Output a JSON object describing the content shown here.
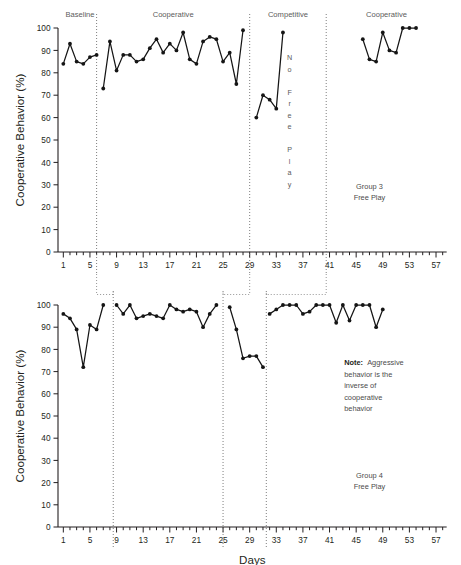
{
  "figure": {
    "width": 461,
    "height": 565,
    "background": "#ffffff",
    "ink_color": "#151515",
    "label_color": "#5b5b5b"
  },
  "axis_common": {
    "ylabel": "Cooperative Behavior (%)",
    "yticks": [
      0,
      10,
      20,
      30,
      40,
      50,
      60,
      70,
      80,
      90,
      100
    ],
    "ylim": [
      0,
      100
    ],
    "xlim": [
      0.2,
      58.8
    ],
    "xticks_labeled": [
      1,
      5,
      9,
      13,
      17,
      21,
      25,
      29,
      33,
      37,
      41,
      45,
      49,
      53,
      57
    ],
    "xtick_step_minor": 1,
    "grid": false,
    "legend": false
  },
  "xlabel": "Days",
  "chart_data": [
    {
      "type": "line",
      "id": "group3",
      "title": "Group 3 Free Play",
      "xlabel": "",
      "ylabel": "Cooperative Behavior (%)",
      "ylim": [
        0,
        100
      ],
      "xlim": [
        0.2,
        58.8
      ],
      "grid": false,
      "legend": false,
      "annotations": [
        {
          "text": "Group 3",
          "x": 47,
          "y": 28
        },
        {
          "text": "Free Play",
          "x": 47,
          "y": 23
        }
      ],
      "no_free_play_text": "No Free Play",
      "no_free_play_letters": [
        "N",
        "o",
        "",
        "F",
        "r",
        "e",
        "e",
        "",
        "P",
        "l",
        "a",
        "y"
      ],
      "phases": [
        {
          "label": "Baseline",
          "start": 1,
          "end": 6
        },
        {
          "label": "Cooperative",
          "start": 6,
          "end": 29
        },
        {
          "label": "Competitive",
          "start": 29,
          "end": 40.5
        },
        {
          "label": "Cooperative",
          "start": 40.5,
          "end": 58.8
        }
      ],
      "phase_boundaries": [
        6.0,
        29.0,
        40.5
      ],
      "series": [
        {
          "name": "Baseline",
          "x": [
            1,
            2,
            3,
            4,
            5,
            6
          ],
          "values": [
            84,
            93,
            85,
            84,
            87,
            88
          ]
        },
        {
          "name": "Cooperative 1",
          "x": [
            7,
            8,
            9,
            10,
            11,
            12,
            13,
            14,
            15,
            16,
            17,
            18,
            19,
            20,
            21,
            22,
            23,
            24,
            25,
            26,
            27,
            28
          ],
          "values": [
            73,
            94,
            81,
            88,
            88,
            85,
            86,
            91,
            95,
            89,
            93,
            90,
            98,
            86,
            84,
            94,
            96,
            95,
            85,
            89,
            75,
            99
          ]
        },
        {
          "name": "Competitive",
          "x": [
            30,
            31,
            32,
            33,
            34
          ],
          "values": [
            60,
            70,
            68,
            64,
            98
          ]
        },
        {
          "name": "Cooperative 2",
          "x": [
            46,
            47,
            48,
            49,
            50,
            51,
            52,
            53,
            54
          ],
          "values": [
            95,
            86,
            85,
            98,
            90,
            89,
            100,
            100,
            100
          ]
        }
      ]
    },
    {
      "type": "line",
      "id": "group4",
      "title": "Group 4 Free Play",
      "xlabel": "Days",
      "ylabel": "Cooperative Behavior (%)",
      "ylim": [
        0,
        100
      ],
      "xlim": [
        0.2,
        58.8
      ],
      "grid": false,
      "legend": false,
      "annotations": [
        {
          "text": "Group 4",
          "x": 47,
          "y": 22
        },
        {
          "text": "Free Play",
          "x": 47,
          "y": 17
        }
      ],
      "note_bold": "Note:",
      "note_lines": [
        "Aggressive",
        "behavior is the",
        "inverse of",
        "cooperative",
        "behavior"
      ],
      "phases": [
        {
          "label": "Baseline",
          "start": 1,
          "end": 8.5
        },
        {
          "label": "Cooperative",
          "start": 8.5,
          "end": 25
        },
        {
          "label": "Competitive",
          "start": 25,
          "end": 31.5
        },
        {
          "label": "Cooperative",
          "start": 31.5,
          "end": 58.8
        }
      ],
      "phase_boundaries": [
        8.5,
        25.0,
        31.5
      ],
      "series": [
        {
          "name": "Baseline",
          "x": [
            1,
            2,
            3,
            4,
            5,
            6,
            7
          ],
          "values": [
            96,
            94,
            89,
            72,
            91,
            89,
            100
          ]
        },
        {
          "name": "Cooperative 1",
          "x": [
            9,
            10,
            11,
            12,
            13,
            14,
            15,
            16,
            17,
            18,
            19,
            20,
            21,
            22,
            23,
            24
          ],
          "values": [
            100,
            96,
            100,
            94,
            95,
            96,
            95,
            94,
            100,
            98,
            97,
            98,
            97,
            90,
            96,
            100
          ]
        },
        {
          "name": "Competitive",
          "x": [
            26,
            27,
            28,
            29,
            30,
            31
          ],
          "values": [
            99,
            89,
            76,
            77,
            77,
            72
          ]
        },
        {
          "name": "Cooperative 2",
          "x": [
            32,
            33,
            34,
            35,
            36,
            37,
            38,
            39,
            40,
            41,
            42,
            43,
            44,
            45,
            46,
            47,
            48,
            49
          ],
          "values": [
            96,
            98,
            100,
            100,
            100,
            96,
            97,
            100,
            100,
            100,
            92,
            100,
            93,
            100,
            100,
            100,
            90,
            98
          ]
        }
      ]
    }
  ],
  "connectors": [
    {
      "from_chart": "group3",
      "x_top": 6.0,
      "to_chart": "group4",
      "x_bottom": 8.5
    },
    {
      "from_chart": "group3",
      "x_top": 29.0,
      "to_chart": "group4",
      "x_bottom": 25.0
    },
    {
      "from_chart": "group3",
      "x_top": 40.5,
      "to_chart": "group4",
      "x_bottom": 31.5
    }
  ]
}
